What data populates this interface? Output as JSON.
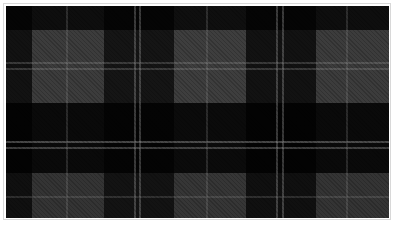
{
  "image": {
    "subject": "plaid fabric swatch",
    "pattern": "tartan check",
    "colors": {
      "black_band": "#121212",
      "dark_grey_band": "#3c3c3c",
      "light_grey_band": "#5a5a5a",
      "stripe": "#a0a0a0",
      "frame": "#ffffff"
    }
  }
}
